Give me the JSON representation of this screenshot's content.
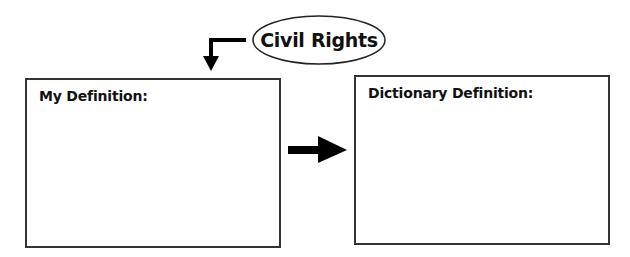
{
  "topic": {
    "label": "Civil Rights",
    "shape": "ellipse"
  },
  "boxes": {
    "left": {
      "label": "My Definition:"
    },
    "right": {
      "label": "Dictionary Definition:"
    }
  },
  "connectors": {
    "topic_to_left": "elbow-arrow-down-icon",
    "left_to_right": "right-arrow-icon"
  },
  "colors": {
    "stroke": "#333333",
    "fill": "#000000",
    "background": "#ffffff"
  }
}
